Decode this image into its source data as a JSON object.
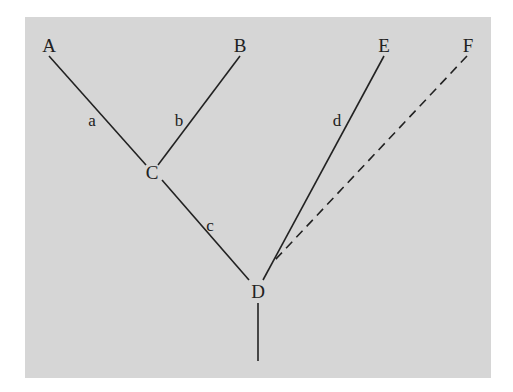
{
  "diagram": {
    "type": "tree",
    "background": "#d6d6d6",
    "line_color": "#222222",
    "nodes": [
      {
        "id": "A",
        "label": "A",
        "x": 49,
        "y": 45
      },
      {
        "id": "B",
        "label": "B",
        "x": 240,
        "y": 45
      },
      {
        "id": "E",
        "label": "E",
        "x": 384,
        "y": 45
      },
      {
        "id": "F",
        "label": "F",
        "x": 468,
        "y": 45
      },
      {
        "id": "C",
        "label": "C",
        "x": 152,
        "y": 172
      },
      {
        "id": "D",
        "label": "D",
        "x": 258,
        "y": 291
      }
    ],
    "edges": [
      {
        "from": "A",
        "to": "C",
        "label": "a",
        "style": "solid"
      },
      {
        "from": "B",
        "to": "C",
        "label": "b",
        "style": "solid"
      },
      {
        "from": "C",
        "to": "D",
        "label": "c",
        "style": "solid"
      },
      {
        "from": "E",
        "to": "D",
        "label": "d",
        "style": "solid"
      },
      {
        "from": "F",
        "to": "D",
        "label": "",
        "style": "dashed"
      },
      {
        "from": "D",
        "to": "root",
        "label": "",
        "style": "solid"
      }
    ]
  }
}
